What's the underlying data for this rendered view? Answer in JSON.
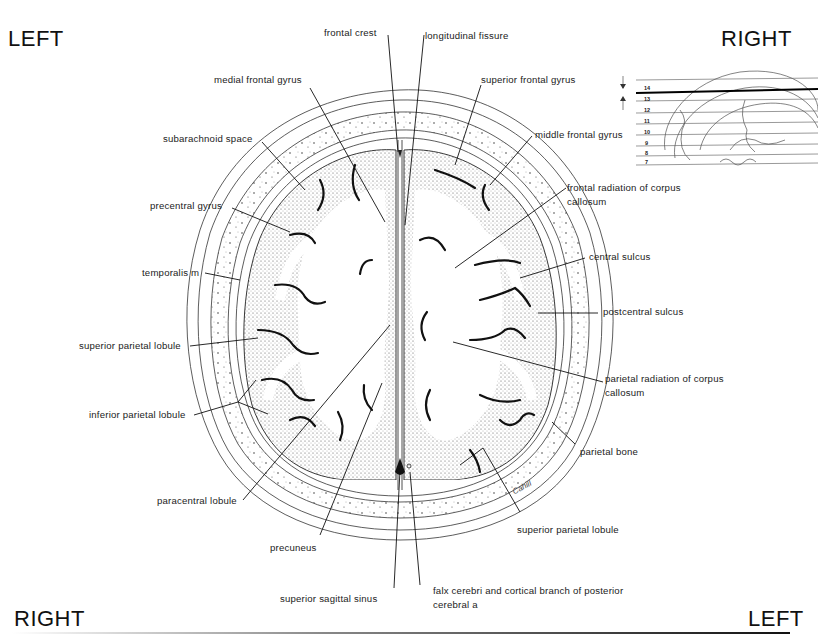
{
  "orientation": {
    "top_left": "LEFT",
    "top_right": "RIGHT",
    "bottom_left": "RIGHT",
    "bottom_right": "LEFT"
  },
  "labels": {
    "frontal_crest": "frontal crest",
    "longitudinal_fissure": "longitudinal fissure",
    "medial_frontal_gyrus": "medial frontal gyrus",
    "superior_frontal_gyrus": "superior frontal gyrus",
    "subarachnoid_space": "subarachnoid space",
    "middle_frontal_gyrus": "middle frontal gyrus",
    "precentral_gyrus": "precentral gyrus",
    "frontal_radiation_cc": "frontal radiation of corpus callosum",
    "temporalis_m": "temporalis m",
    "central_sulcus": "central sulcus",
    "postcentral_sulcus": "postcentral sulcus",
    "superior_parietal_lobule_left": "superior parietal lobule",
    "parietal_radiation_cc": "parietal radiation of corpus callosum",
    "inferior_parietal_lobule": "inferior parietal lobule",
    "parietal_bone": "parietal bone",
    "paracentral_lobule": "paracentral lobule",
    "superior_parietal_lobule_right": "superior parietal lobule",
    "precuneus": "precuneus",
    "superior_sagittal_sinus": "superior sagittal sinus",
    "falx_cerebri": "falx cerebri and cortical branch of posterior cerebral a"
  },
  "reference_inset": {
    "levels": [
      "14",
      "13",
      "12",
      "11",
      "10",
      "9",
      "8",
      "7"
    ],
    "selected_level": "14"
  },
  "artist_signature": "Cahill"
}
